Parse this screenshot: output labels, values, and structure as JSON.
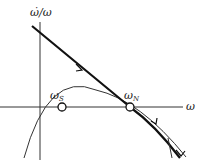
{
  "diagram": {
    "y_axis_label": "ω̇/ω",
    "x_axis_label": "ω",
    "points": [
      {
        "id": "omega_s",
        "label": "ω",
        "subscript": "S"
      },
      {
        "id": "omega_n",
        "label": "ω",
        "subscript": "N"
      }
    ],
    "colors": {
      "stroke": "#1a1a1a",
      "background": "#ffffff"
    }
  }
}
